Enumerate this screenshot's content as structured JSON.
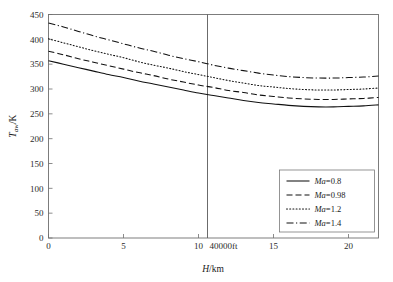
{
  "chart_data": {
    "type": "line",
    "title": "",
    "xlabel": "H/km",
    "ylabel": "T_aw/K",
    "xlabel_parts": {
      "italic": "H",
      "rest": "/km"
    },
    "ylabel_parts": {
      "italic": "T",
      "sub": "aw",
      "rest": "/K"
    },
    "xlim": [
      0,
      22
    ],
    "ylim": [
      0,
      450
    ],
    "xticks": [
      0,
      5,
      10,
      15,
      20
    ],
    "xtick_labels": [
      "0",
      "5",
      "10",
      "15",
      "20"
    ],
    "yticks": [
      0,
      50,
      100,
      150,
      200,
      250,
      300,
      350,
      400,
      450
    ],
    "ytick_labels": [
      "0",
      "50",
      "100",
      "150",
      "200",
      "250",
      "300",
      "350",
      "400",
      "450"
    ],
    "grid": false,
    "legend_position": "lower right",
    "annotations": [
      {
        "name": "altitude-marker",
        "text": "40000ft",
        "x": 10.6,
        "type": "vertical-line"
      }
    ],
    "x": [
      0,
      1,
      2,
      3,
      4,
      5,
      6,
      7,
      8,
      9,
      10,
      11,
      12,
      13,
      14,
      15,
      16,
      17,
      18,
      19,
      20,
      21,
      22
    ],
    "series": [
      {
        "name": "Ma=0.8",
        "label_parts": {
          "italic": "Ma",
          "rest": "=0.8"
        },
        "style": "solid",
        "values": [
          357,
          350,
          343,
          336,
          329,
          323,
          316,
          310,
          304,
          298,
          292,
          287,
          282,
          277,
          273,
          270,
          267,
          265,
          264,
          264,
          265,
          266,
          268
        ]
      },
      {
        "name": "Ma=0.98",
        "label_parts": {
          "italic": "Ma",
          "rest": "=0.98"
        },
        "style": "dashed",
        "values": [
          376,
          369,
          361,
          354,
          347,
          340,
          333,
          327,
          320,
          314,
          308,
          303,
          297,
          293,
          288,
          285,
          282,
          280,
          279,
          279,
          280,
          281,
          283
        ]
      },
      {
        "name": "Ma=1.2",
        "label_parts": {
          "italic": "Ma",
          "rest": "=1.2"
        },
        "style": "dotted",
        "values": [
          401,
          393,
          385,
          377,
          370,
          363,
          355,
          348,
          342,
          335,
          329,
          323,
          317,
          312,
          307,
          304,
          301,
          299,
          298,
          298,
          299,
          300,
          302
        ]
      },
      {
        "name": "Ma=1.4",
        "label_parts": {
          "italic": "Ma",
          "rest": "=1.4"
        },
        "style": "dashdot",
        "values": [
          433,
          425,
          416,
          407,
          399,
          391,
          383,
          376,
          368,
          361,
          355,
          348,
          342,
          337,
          332,
          328,
          325,
          323,
          322,
          322,
          323,
          324,
          326
        ]
      }
    ]
  },
  "colors": {
    "curve": "#111111",
    "frame": "#6f6f6f",
    "text": "#1a1a1a",
    "background": "#ffffff"
  }
}
